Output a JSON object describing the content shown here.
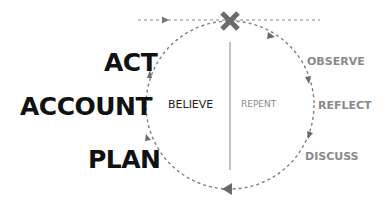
{
  "diagram": {
    "left_labels": [
      {
        "text": "ACT"
      },
      {
        "text": "ACCOUNT"
      },
      {
        "text": "PLAN"
      }
    ],
    "right_labels": [
      {
        "text": "OBSERVE"
      },
      {
        "text": "REFLECT"
      },
      {
        "text": "DISCUSS"
      }
    ],
    "inner_labels": {
      "left": "BELIEVE",
      "right": "REPENT"
    },
    "colors": {
      "dashed": "#777777",
      "cross": "#6b6b6b",
      "divider": "#999999",
      "left_text": "#111111",
      "right_text": "#8a8a8a"
    },
    "icons": {
      "top": "cross-x-icon"
    }
  }
}
